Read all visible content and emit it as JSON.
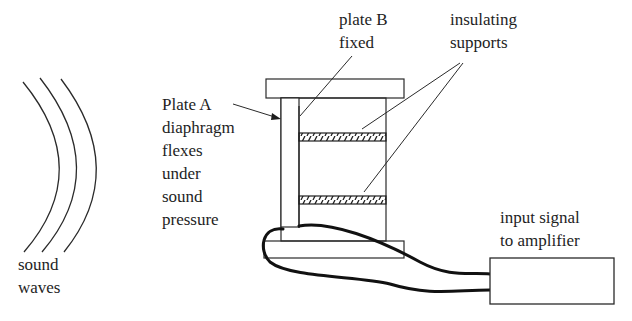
{
  "diagram": {
    "type": "condenser-microphone-schematic",
    "labels": {
      "sound_waves": [
        "sound",
        "waves"
      ],
      "plate_a": [
        "Plate A",
        "diaphragm",
        "flexes",
        "under",
        "sound",
        "pressure"
      ],
      "plate_b": [
        "plate B",
        "fixed"
      ],
      "insulating_supports": [
        "insulating",
        "supports"
      ],
      "amplifier": [
        "input signal",
        "to amplifier"
      ]
    },
    "components": [
      {
        "id": "sound-waves",
        "label": "sound waves",
        "count": 3
      },
      {
        "id": "plate-a",
        "label": "Plate A diaphragm flexes under sound pressure"
      },
      {
        "id": "plate-b",
        "label": "plate B fixed"
      },
      {
        "id": "insulating-supports",
        "label": "insulating supports",
        "count": 2
      },
      {
        "id": "housing-frame",
        "label": ""
      },
      {
        "id": "amplifier-box",
        "label": "input signal to amplifier"
      }
    ],
    "connections": [
      {
        "from": "plate-a",
        "to": "amplifier-box",
        "kind": "wire"
      },
      {
        "from": "plate-b",
        "to": "amplifier-box",
        "kind": "wire"
      }
    ],
    "colors": {
      "ink": "#1e1e1e",
      "background": "#ffffff"
    }
  }
}
